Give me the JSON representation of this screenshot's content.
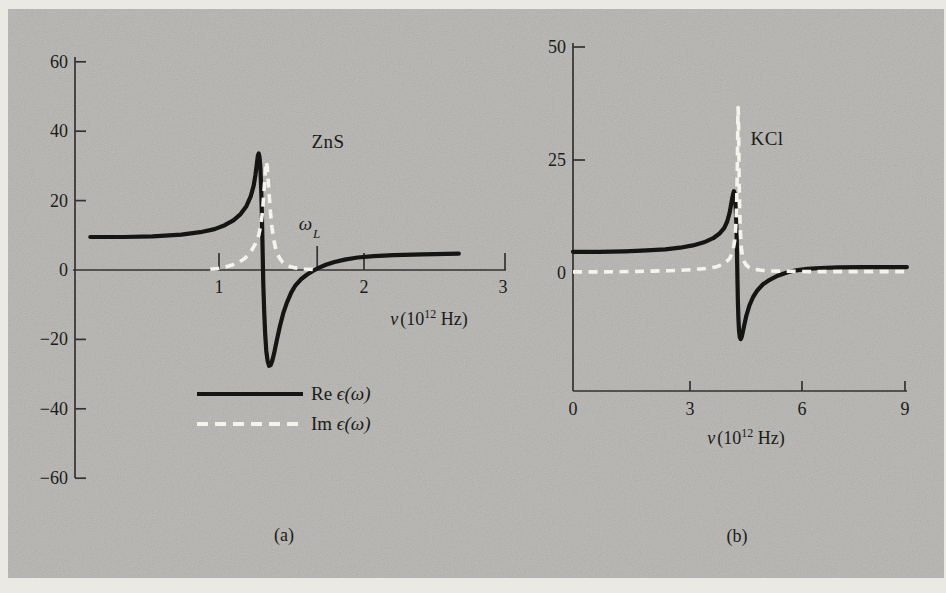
{
  "figure": {
    "page_color": "#ebe9e4",
    "panel_color": "#b5b4b1",
    "axis_color": "#343230",
    "text_color": "#1c1b19",
    "re_color": "#151513",
    "im_color": "#f5f3ec"
  },
  "legend": {
    "items": [
      {
        "prefix": "Re ",
        "math": "ϵ(ω)",
        "style": "solid"
      },
      {
        "prefix": "Im ",
        "math": "ϵ(ω)",
        "style": "dashed"
      }
    ]
  },
  "chart_data": [
    {
      "type": "line",
      "title": "ZnS",
      "caption": "(a)",
      "xlabel": {
        "sym": "ν",
        "open": "(10",
        "sup": "12",
        "close": "Hz)"
      },
      "x_range": [
        0,
        3
      ],
      "y_range": [
        -60,
        60
      ],
      "grid": false,
      "x_ticks": [
        {
          "value": 1,
          "label": "1"
        },
        {
          "value": 2,
          "label": "2"
        },
        {
          "value": 3,
          "label": "3"
        }
      ],
      "y_ticks": [
        {
          "value": 60,
          "label": "60",
          "tick": true
        },
        {
          "value": 40,
          "label": "40",
          "tick": true
        },
        {
          "value": 20,
          "label": "20",
          "tick": true
        },
        {
          "value": 0,
          "label": "0",
          "tick": false
        },
        {
          "value": -20,
          "label": "−20",
          "tick": true
        },
        {
          "value": -40,
          "label": "−40",
          "tick": true
        },
        {
          "value": -60,
          "label": "−60",
          "tick": true
        }
      ],
      "annotations": [
        {
          "sym": "ω",
          "sub": "L",
          "x": 1.69,
          "style": "tick-above-axis"
        }
      ],
      "series": [
        {
          "name": "Re ϵ(ω)",
          "style": "solid",
          "points": [
            [
              0.12,
              9.5
            ],
            [
              0.35,
              9.5
            ],
            [
              0.55,
              9.7
            ],
            [
              0.75,
              10.2
            ],
            [
              0.88,
              10.9
            ],
            [
              0.98,
              11.8
            ],
            [
              1.05,
              12.9
            ],
            [
              1.11,
              14.3
            ],
            [
              1.16,
              16.1
            ],
            [
              1.2,
              18.4
            ],
            [
              1.23,
              21.2
            ],
            [
              1.25,
              24.2
            ],
            [
              1.263,
              27.5
            ],
            [
              1.272,
              30.5
            ],
            [
              1.279,
              32.8
            ],
            [
              1.285,
              33.6
            ],
            [
              1.291,
              32.6
            ],
            [
              1.297,
              29.5
            ],
            [
              1.302,
              24
            ],
            [
              1.307,
              16
            ],
            [
              1.312,
              6
            ],
            [
              1.317,
              -4
            ],
            [
              1.323,
              -12
            ],
            [
              1.33,
              -18.6
            ],
            [
              1.338,
              -23.3
            ],
            [
              1.347,
              -26.2
            ],
            [
              1.357,
              -27.6
            ],
            [
              1.368,
              -27.4
            ],
            [
              1.38,
              -26
            ],
            [
              1.394,
              -23.6
            ],
            [
              1.412,
              -20
            ],
            [
              1.432,
              -16.2
            ],
            [
              1.455,
              -12.5
            ],
            [
              1.48,
              -9.4
            ],
            [
              1.51,
              -6.5
            ],
            [
              1.54,
              -4.4
            ],
            [
              1.58,
              -2.6
            ],
            [
              1.62,
              -1.3
            ],
            [
              1.66,
              -0.3
            ],
            [
              1.7,
              0.6
            ],
            [
              1.75,
              1.5
            ],
            [
              1.81,
              2.3
            ],
            [
              1.88,
              3.0
            ],
            [
              1.97,
              3.6
            ],
            [
              2.08,
              4.0
            ],
            [
              2.22,
              4.3
            ],
            [
              2.42,
              4.5
            ],
            [
              2.67,
              4.7
            ]
          ]
        },
        {
          "name": "Im ϵ(ω)",
          "style": "dashed",
          "points": [
            [
              0.95,
              0.2
            ],
            [
              1.0,
              0.4
            ],
            [
              1.05,
              0.8
            ],
            [
              1.1,
              1.4
            ],
            [
              1.15,
              2.3
            ],
            [
              1.19,
              3.4
            ],
            [
              1.23,
              5.2
            ],
            [
              1.26,
              7.4
            ],
            [
              1.285,
              10
            ],
            [
              1.3,
              13
            ],
            [
              1.312,
              17
            ],
            [
              1.32,
              21.5
            ],
            [
              1.327,
              26
            ],
            [
              1.333,
              29.8
            ],
            [
              1.338,
              31.2
            ],
            [
              1.344,
              29.8
            ],
            [
              1.35,
              26.5
            ],
            [
              1.358,
              21.5
            ],
            [
              1.367,
              16.5
            ],
            [
              1.377,
              12.2
            ],
            [
              1.388,
              9.0
            ],
            [
              1.4,
              6.6
            ],
            [
              1.415,
              4.7
            ],
            [
              1.43,
              3.4
            ],
            [
              1.45,
              2.3
            ],
            [
              1.475,
              1.5
            ],
            [
              1.5,
              1.0
            ],
            [
              1.54,
              0.6
            ],
            [
              1.6,
              0.3
            ],
            [
              1.68,
              0.15
            ]
          ]
        }
      ]
    },
    {
      "type": "line",
      "title": "KCl",
      "caption": "(b)",
      "xlabel": {
        "sym": "ν",
        "open": "(10",
        "sup": "12",
        "close": "Hz)"
      },
      "x_range": [
        0,
        9
      ],
      "y_range": [
        -26,
        50
      ],
      "grid": false,
      "x_ticks": [
        {
          "value": 0,
          "label": "0"
        },
        {
          "value": 3,
          "label": "3"
        },
        {
          "value": 6,
          "label": "6"
        },
        {
          "value": 9,
          "label": "9"
        }
      ],
      "y_ticks": [
        {
          "value": 50,
          "label": "50",
          "tick": true
        },
        {
          "value": 25,
          "label": "25",
          "tick": true
        },
        {
          "value": 0,
          "label": "0",
          "tick": false
        }
      ],
      "annotations": [],
      "series": [
        {
          "name": "Re ϵ(ω)",
          "style": "solid",
          "points": [
            [
              0,
              4.7
            ],
            [
              0.7,
              4.7
            ],
            [
              1.4,
              4.8
            ],
            [
              2.0,
              5.0
            ],
            [
              2.5,
              5.25
            ],
            [
              2.9,
              5.6
            ],
            [
              3.25,
              6.1
            ],
            [
              3.55,
              6.8
            ],
            [
              3.8,
              7.7
            ],
            [
              3.98,
              8.8
            ],
            [
              4.1,
              10
            ],
            [
              4.18,
              11.4
            ],
            [
              4.24,
              13.2
            ],
            [
              4.29,
              15.4
            ],
            [
              4.33,
              17.2
            ],
            [
              4.36,
              18.1
            ],
            [
              4.38,
              17.6
            ],
            [
              4.4,
              15.8
            ],
            [
              4.42,
              12.5
            ],
            [
              4.435,
              8
            ],
            [
              4.447,
              3
            ],
            [
              4.458,
              -2
            ],
            [
              4.47,
              -6.5
            ],
            [
              4.483,
              -10
            ],
            [
              4.5,
              -12.7
            ],
            [
              4.52,
              -14.2
            ],
            [
              4.545,
              -14.6
            ],
            [
              4.57,
              -14.2
            ],
            [
              4.6,
              -13.2
            ],
            [
              4.64,
              -11.6
            ],
            [
              4.7,
              -9.4
            ],
            [
              4.78,
              -7.2
            ],
            [
              4.88,
              -5.3
            ],
            [
              5.0,
              -3.8
            ],
            [
              5.15,
              -2.5
            ],
            [
              5.33,
              -1.5
            ],
            [
              5.55,
              -0.6
            ],
            [
              5.8,
              0.1
            ],
            [
              6.05,
              0.6
            ],
            [
              6.35,
              0.9
            ],
            [
              6.7,
              1.1
            ],
            [
              7.2,
              1.25
            ],
            [
              7.9,
              1.3
            ],
            [
              8.6,
              1.3
            ],
            [
              9.05,
              1.3
            ]
          ]
        },
        {
          "name": "Im ϵ(ω)",
          "style": "dashed",
          "points": [
            [
              0,
              0.25
            ],
            [
              0.9,
              0.25
            ],
            [
              1.8,
              0.35
            ],
            [
              2.6,
              0.5
            ],
            [
              3.2,
              0.7
            ],
            [
              3.6,
              1.0
            ],
            [
              3.9,
              1.4
            ],
            [
              4.1,
              2.1
            ],
            [
              4.25,
              3.2
            ],
            [
              4.33,
              4.8
            ],
            [
              4.38,
              7
            ],
            [
              4.41,
              10
            ],
            [
              4.43,
              14
            ],
            [
              4.445,
              19
            ],
            [
              4.455,
              25
            ],
            [
              4.463,
              31
            ],
            [
              4.469,
              35
            ],
            [
              4.474,
              36.6
            ],
            [
              4.48,
              35.5
            ],
            [
              4.487,
              32
            ],
            [
              4.495,
              26
            ],
            [
              4.505,
              19.5
            ],
            [
              4.52,
              13.5
            ],
            [
              4.535,
              9.5
            ],
            [
              4.55,
              7
            ],
            [
              4.57,
              5
            ],
            [
              4.6,
              3.5
            ],
            [
              4.64,
              2.5
            ],
            [
              4.7,
              1.7
            ],
            [
              4.78,
              1.2
            ],
            [
              4.9,
              0.85
            ],
            [
              5.1,
              0.6
            ],
            [
              5.4,
              0.45
            ],
            [
              5.8,
              0.37
            ],
            [
              6.4,
              0.32
            ],
            [
              7.2,
              0.3
            ],
            [
              8.2,
              0.3
            ],
            [
              9.05,
              0.3
            ]
          ]
        }
      ]
    }
  ]
}
